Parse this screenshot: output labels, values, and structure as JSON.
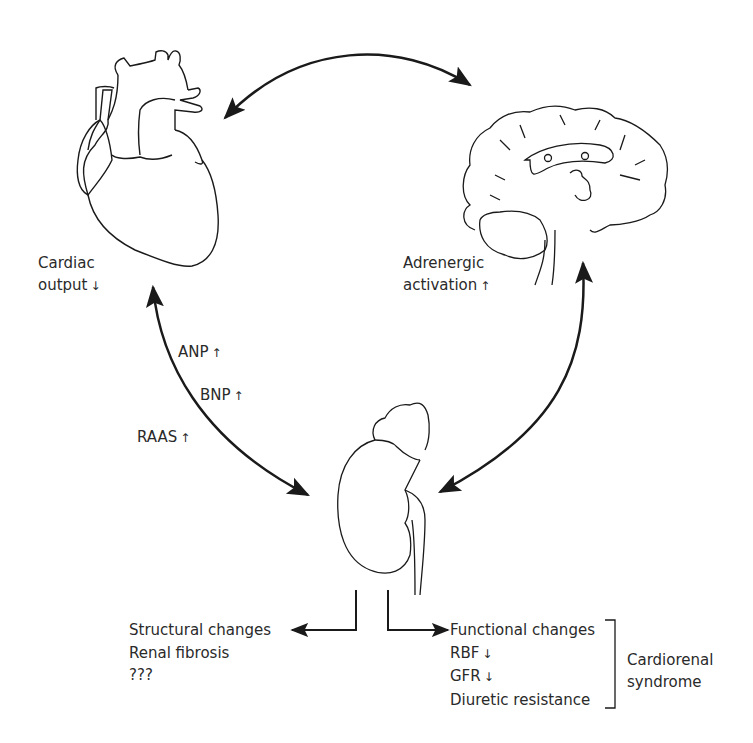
{
  "organs": {
    "heart": {
      "name": "heart",
      "label_line1": "Cardiac",
      "label_line2": "output",
      "indicator": "↓"
    },
    "brain": {
      "name": "brain",
      "label_line1": "Adrenergic",
      "label_line2": "activation",
      "indicator": "↑"
    },
    "kidney": {
      "name": "kidney"
    }
  },
  "heart_kidney_link": {
    "labels": [
      {
        "text": "ANP",
        "indicator": "↑"
      },
      {
        "text": "BNP",
        "indicator": "↑"
      },
      {
        "text": "RAAS",
        "indicator": "↑"
      }
    ]
  },
  "outcomes": {
    "structural": [
      "Structural changes",
      "Renal fibrosis",
      "???"
    ],
    "functional": {
      "header": "Functional changes",
      "items": [
        {
          "text": "RBF",
          "indicator": "↓"
        },
        {
          "text": "GFR",
          "indicator": "↓"
        },
        {
          "text": "Diuretic resistance",
          "indicator": ""
        }
      ]
    },
    "bracket_label_line1": "Cardiorenal",
    "bracket_label_line2": "syndrome"
  },
  "colors": {
    "stroke": "#1a1a1a",
    "text": "#2a2a2a",
    "background": "#ffffff"
  }
}
